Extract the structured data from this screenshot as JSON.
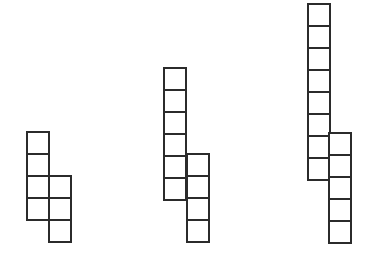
{
  "diagram": {
    "colors": {
      "stroke": "#2b2b2b",
      "fill": "#ffffff",
      "background": "#ffffff"
    },
    "figures": [
      {
        "id": "figure-1",
        "cell_size": 22,
        "columns": [
          {
            "x": 26,
            "top": 131,
            "count": 4
          },
          {
            "x": 48,
            "top": 175,
            "count": 3
          }
        ]
      },
      {
        "id": "figure-2",
        "cell_size": 22,
        "columns": [
          {
            "x": 163,
            "top": 67,
            "count": 6
          },
          {
            "x": 186,
            "top": 153,
            "count": 4
          }
        ]
      },
      {
        "id": "figure-3",
        "cell_size": 22,
        "columns": [
          {
            "x": 307,
            "top": 3,
            "count": 8
          },
          {
            "x": 328,
            "top": 132,
            "count": 5
          }
        ]
      }
    ]
  }
}
